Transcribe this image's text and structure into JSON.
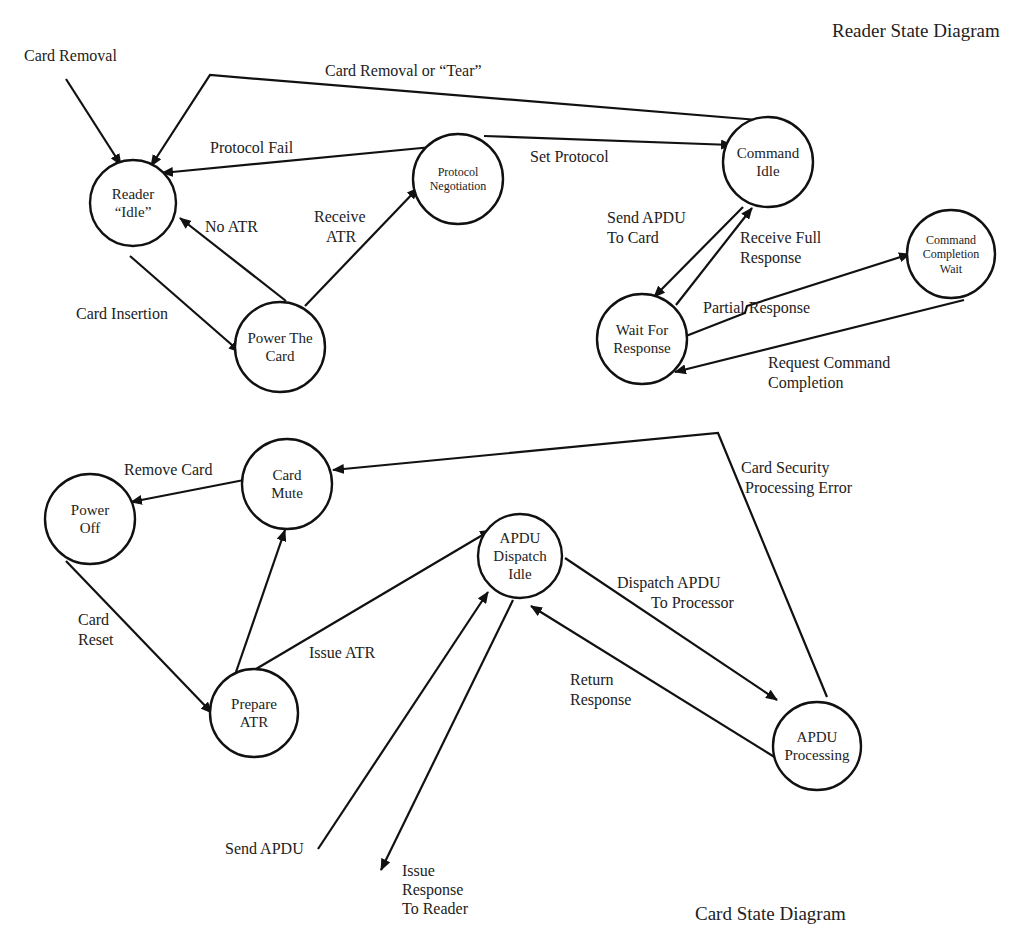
{
  "titles": {
    "reader": "Reader State Diagram",
    "card": "Card State Diagram"
  },
  "style": {
    "stroke": "#111111",
    "text": "#222222",
    "background": "#ffffff"
  },
  "reader_diagram": {
    "nodes": [
      {
        "id": "reader-idle",
        "cx": 133,
        "cy": 203,
        "r": 43,
        "lines": [
          "Reader",
          "“Idle”"
        ],
        "fs": 15
      },
      {
        "id": "protocol-negotiation",
        "cx": 458,
        "cy": 179,
        "r": 45,
        "lines": [
          "Protocol",
          "Negotiation"
        ],
        "fs": 12
      },
      {
        "id": "command-idle",
        "cx": 768,
        "cy": 162,
        "r": 45,
        "lines": [
          "Command",
          "Idle"
        ],
        "fs": 15
      },
      {
        "id": "power-the-card",
        "cx": 280,
        "cy": 347,
        "r": 45,
        "lines": [
          "Power The",
          "Card"
        ],
        "fs": 15
      },
      {
        "id": "wait-for-response",
        "cx": 642,
        "cy": 339,
        "r": 45,
        "lines": [
          "Wait For",
          "Response"
        ],
        "fs": 15
      },
      {
        "id": "command-completion-wait",
        "cx": 951,
        "cy": 254,
        "r": 44,
        "lines": [
          "Command",
          "Completion",
          "Wait"
        ],
        "fs": 12
      }
    ],
    "edges": [
      {
        "points": [
          [
            66,
            79
          ],
          [
            121,
            165
          ]
        ],
        "arrow": true
      },
      {
        "points": [
          [
            758,
            120
          ],
          [
            210,
            75
          ],
          [
            151,
            166
          ]
        ],
        "arrow": true
      },
      {
        "points": [
          [
            432,
            147
          ],
          [
            162,
            173
          ]
        ],
        "arrow": true
      },
      {
        "points": [
          [
            484,
            136
          ],
          [
            732,
            145
          ]
        ],
        "arrow": true
      },
      {
        "points": [
          [
            130,
            256
          ],
          [
            240,
            352
          ]
        ],
        "arrow": true
      },
      {
        "points": [
          [
            286,
            301
          ],
          [
            180,
            218
          ]
        ],
        "arrow": true
      },
      {
        "points": [
          [
            305,
            306
          ],
          [
            418,
            188
          ]
        ],
        "arrow": true
      },
      {
        "points": [
          [
            743,
            207
          ],
          [
            654,
            297
          ]
        ],
        "arrow": true
      },
      {
        "points": [
          [
            676,
            305
          ],
          [
            752,
            208
          ]
        ],
        "arrow": true
      },
      {
        "points": [
          [
            686,
            336
          ],
          [
            745,
            313
          ],
          [
            747,
            306
          ],
          [
            910,
            254
          ]
        ],
        "arrow": true
      },
      {
        "points": [
          [
            964,
            300
          ],
          [
            675,
            372
          ]
        ],
        "arrow": true
      }
    ],
    "labels": [
      {
        "text": "Card Removal",
        "x": 24,
        "y": 61,
        "fs": 16
      },
      {
        "text": "Card Removal or “Tear”",
        "x": 325,
        "y": 76,
        "fs": 16
      },
      {
        "text": "Protocol Fail",
        "x": 210,
        "y": 153,
        "fs": 16
      },
      {
        "text": "Set Protocol",
        "x": 530,
        "y": 162,
        "fs": 16
      },
      {
        "text": "No ATR",
        "x": 205,
        "y": 232,
        "fs": 16
      },
      {
        "text": "Receive",
        "x": 314,
        "y": 222,
        "fs": 16
      },
      {
        "text": "ATR",
        "x": 326,
        "y": 242,
        "fs": 16
      },
      {
        "text": "Card Insertion",
        "x": 76,
        "y": 319,
        "fs": 16
      },
      {
        "text": "Send APDU",
        "x": 607,
        "y": 223,
        "fs": 16
      },
      {
        "text": "To Card",
        "x": 607,
        "y": 243,
        "fs": 16
      },
      {
        "text": "Receive Full",
        "x": 740,
        "y": 243,
        "fs": 16
      },
      {
        "text": "Response",
        "x": 740,
        "y": 263,
        "fs": 16
      },
      {
        "text": "Partial Response",
        "x": 703,
        "y": 313,
        "fs": 16
      },
      {
        "text": "Request Command",
        "x": 768,
        "y": 368,
        "fs": 16
      },
      {
        "text": "Completion",
        "x": 768,
        "y": 388,
        "fs": 16
      }
    ]
  },
  "card_diagram": {
    "nodes": [
      {
        "id": "power-off",
        "cx": 90,
        "cy": 519,
        "r": 45,
        "lines": [
          "Power",
          "Off"
        ],
        "fs": 15
      },
      {
        "id": "card-mute",
        "cx": 287,
        "cy": 484,
        "r": 45,
        "lines": [
          "Card",
          "Mute"
        ],
        "fs": 15
      },
      {
        "id": "apdu-dispatch-idle",
        "cx": 520,
        "cy": 556,
        "r": 42,
        "lines": [
          "APDU",
          "Dispatch",
          "Idle"
        ],
        "fs": 15
      },
      {
        "id": "prepare-atr",
        "cx": 254,
        "cy": 713,
        "r": 44,
        "lines": [
          "Prepare",
          "ATR"
        ],
        "fs": 15
      },
      {
        "id": "apdu-processing",
        "cx": 817,
        "cy": 746,
        "r": 44,
        "lines": [
          "APDU",
          "Processing"
        ],
        "fs": 15
      }
    ],
    "edges": [
      {
        "points": [
          [
            244,
            480
          ],
          [
            131,
            502
          ]
        ],
        "arrow": true
      },
      {
        "points": [
          [
            827,
            697
          ],
          [
            718,
            433
          ],
          [
            333,
            470
          ]
        ],
        "arrow": true
      },
      {
        "points": [
          [
            66,
            561
          ],
          [
            212,
            713
          ]
        ],
        "arrow": true
      },
      {
        "points": [
          [
            236,
            672
          ],
          [
            285,
            530
          ]
        ],
        "arrow": true
      },
      {
        "points": [
          [
            256,
            669
          ],
          [
            491,
            530
          ]
        ],
        "arrow": true
      },
      {
        "points": [
          [
            565,
            558
          ],
          [
            777,
            700
          ]
        ],
        "arrow": true
      },
      {
        "points": [
          [
            776,
            758
          ],
          [
            531,
            606
          ]
        ],
        "arrow": true
      },
      {
        "points": [
          [
            318,
            849
          ],
          [
            488,
            592
          ]
        ],
        "arrow": true
      },
      {
        "points": [
          [
            513,
            600
          ],
          [
            381,
            870
          ]
        ],
        "arrow": true
      }
    ],
    "labels": [
      {
        "text": "Remove Card",
        "x": 124,
        "y": 475,
        "fs": 16
      },
      {
        "text": "Card Security",
        "x": 741,
        "y": 473,
        "fs": 16
      },
      {
        "text": "Processing Error",
        "x": 745,
        "y": 493,
        "fs": 16
      },
      {
        "text": "Card",
        "x": 78,
        "y": 625,
        "fs": 16
      },
      {
        "text": "Reset",
        "x": 78,
        "y": 645,
        "fs": 16
      },
      {
        "text": "Dispatch APDU",
        "x": 617,
        "y": 588,
        "fs": 16
      },
      {
        "text": "To Processor",
        "x": 651,
        "y": 608,
        "fs": 16
      },
      {
        "text": "Issue ATR",
        "x": 309,
        "y": 658,
        "fs": 16
      },
      {
        "text": "Return",
        "x": 570,
        "y": 685,
        "fs": 16
      },
      {
        "text": "Response",
        "x": 570,
        "y": 705,
        "fs": 16
      },
      {
        "text": "Send APDU",
        "x": 225,
        "y": 854,
        "fs": 16
      },
      {
        "text": "Issue",
        "x": 402,
        "y": 876,
        "fs": 16
      },
      {
        "text": "Response",
        "x": 402,
        "y": 895,
        "fs": 16
      },
      {
        "text": "To Reader",
        "x": 402,
        "y": 914,
        "fs": 16
      }
    ]
  }
}
